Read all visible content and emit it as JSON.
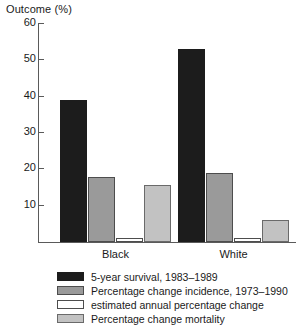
{
  "chart_data": {
    "type": "bar",
    "title": "",
    "ylabel": "Outcome (%)",
    "xlabel": "",
    "ylim": [
      0,
      60
    ],
    "yticks": [
      0,
      10,
      20,
      30,
      40,
      50,
      60
    ],
    "ytick_labels": [
      "",
      "10",
      "20",
      "30",
      "40",
      "50",
      "60"
    ],
    "grid": false,
    "legend_position": "below",
    "categories": [
      "Black",
      "White"
    ],
    "series": [
      {
        "name": "5-year survival, 1983–1989",
        "color": "#1c1c1c",
        "values": [
          39,
          53
        ]
      },
      {
        "name": "Percentage change incidence, 1973–1990",
        "color": "#9a9a9a",
        "values": [
          17.8,
          19
        ]
      },
      {
        "name": "estimated annual percentage change",
        "color": "#ffffff",
        "values": [
          1,
          1
        ]
      },
      {
        "name": "Percentage change mortality",
        "color": "#c2c2c2",
        "values": [
          15.7,
          6
        ]
      }
    ]
  },
  "axis": {
    "y_title": "Outcome (%)"
  },
  "legend": {
    "items": [
      {
        "label": "5-year survival, 1983–1989",
        "swatch": "black"
      },
      {
        "label": "Percentage change incidence, 1973–1990",
        "swatch": "midgray"
      },
      {
        "label": "estimated annual percentage change",
        "swatch": "white"
      },
      {
        "label": "Percentage change mortality",
        "swatch": "lightgray"
      }
    ]
  }
}
